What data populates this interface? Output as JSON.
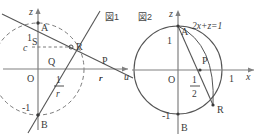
{
  "figure1": {
    "caption": "図1",
    "axis_labels": {
      "vertical": "z",
      "horizontal": "u"
    },
    "origin_label": "O",
    "points": [
      "A",
      "B",
      "P",
      "Q",
      "R",
      "S"
    ],
    "tick_labels": {
      "z_positive": "1",
      "z_negative": "-1",
      "z_c": "c",
      "u_r": "r"
    },
    "fraction": {
      "numerator": "1",
      "denominator": "r"
    },
    "point_labels": {
      "A": "A",
      "B": "B",
      "P": "P",
      "Q": "Q",
      "R": "R",
      "S": "S"
    }
  },
  "figure2": {
    "caption": "図2",
    "axis_labels": {
      "vertical": "z",
      "horizontal": "x"
    },
    "origin_label": "O",
    "equation": "2x+z=1",
    "tick_labels": {
      "z_positive": "1",
      "z_negative": "-1",
      "x_positive": "1"
    },
    "fraction": {
      "numerator": "1",
      "denominator": "2"
    },
    "point_labels": {
      "A": "A",
      "B": "B",
      "P": "P",
      "R": "R"
    }
  },
  "colors": {
    "ink": "#3a3a3a",
    "line": "#555555",
    "axis": "#777777",
    "background": "#ffffff"
  }
}
